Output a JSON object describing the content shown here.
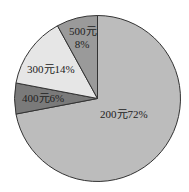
{
  "chart_data": {
    "type": "pie",
    "title": "",
    "start_angle": "top (12 o'clock), clockwise",
    "legend": "none (inline slice labels)",
    "categories": [
      "200元",
      "400元",
      "300元",
      "500元"
    ],
    "values": [
      72,
      6,
      14,
      8
    ],
    "unit": "%",
    "slices": [
      {
        "label": "200元",
        "percent": 72,
        "text": "200元72%",
        "color": "#bcbcbc"
      },
      {
        "label": "400元",
        "percent": 6,
        "text": "400元6%",
        "color": "#7a7a7a"
      },
      {
        "label": "300元",
        "percent": 14,
        "text": "300元14%",
        "color": "#e6e6e6"
      },
      {
        "label": "500元",
        "percent": 8,
        "text_line1": "500元",
        "text_line2": "8%",
        "color": "#9a9a9a"
      }
    ],
    "outline_color": "#333333"
  }
}
